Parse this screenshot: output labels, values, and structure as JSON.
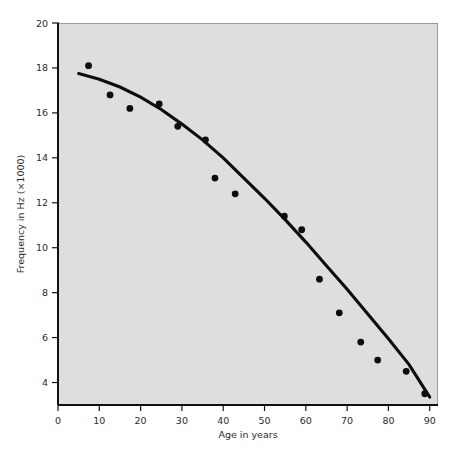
{
  "figure": {
    "corner_mark": "",
    "background_color": "#ffffff",
    "plot_background_color": "#dedede",
    "ink_color": "#0d0d0d"
  },
  "chart_data": {
    "type": "scatter",
    "title": "",
    "subtitle": "",
    "xlabel": "Age in years",
    "ylabel": "Frequency in Hz (×1000)",
    "xlim": [
      0,
      92
    ],
    "ylim": [
      3,
      20
    ],
    "xticks": [
      0,
      10,
      20,
      30,
      40,
      50,
      60,
      70,
      80,
      90
    ],
    "xtick_labels": [
      "0",
      "10",
      "20",
      "30",
      "40",
      "50",
      "60",
      "70",
      "80",
      "90"
    ],
    "yticks": [
      4,
      6,
      8,
      10,
      12,
      14,
      16,
      18,
      20
    ],
    "ytick_labels": [
      "4",
      "6",
      "8",
      "10",
      "12",
      "14",
      "16",
      "18",
      "20"
    ],
    "grid": false,
    "legend": null,
    "legend_position": "none",
    "annotations": [],
    "series": [
      {
        "name": "Observed highest audible frequency",
        "type": "scatter",
        "marker": "filled-circle",
        "color": "#0d0d0d",
        "x": [
          7.4,
          12.6,
          17.4,
          24.5,
          29.0,
          35.7,
          38.0,
          42.9,
          54.8,
          59.0,
          63.3,
          68.1,
          73.3,
          77.4,
          84.3,
          88.8
        ],
        "y": [
          18.1,
          16.8,
          16.2,
          16.4,
          15.4,
          14.8,
          13.1,
          12.4,
          11.4,
          10.8,
          8.6,
          7.1,
          5.8,
          5.0,
          4.5,
          3.5
        ]
      },
      {
        "name": "Fitted trend curve",
        "type": "line",
        "color": "#0d0d0d",
        "x": [
          5.0,
          10.0,
          15.0,
          20.0,
          25.0,
          30.0,
          35.0,
          40.0,
          45.0,
          50.0,
          55.0,
          60.0,
          65.0,
          70.0,
          75.0,
          80.0,
          85.0,
          90.0
        ],
        "y": [
          17.75,
          17.5,
          17.15,
          16.7,
          16.15,
          15.5,
          14.8,
          14.0,
          13.1,
          12.2,
          11.25,
          10.25,
          9.2,
          8.15,
          7.05,
          5.95,
          4.8,
          3.35
        ]
      }
    ]
  }
}
